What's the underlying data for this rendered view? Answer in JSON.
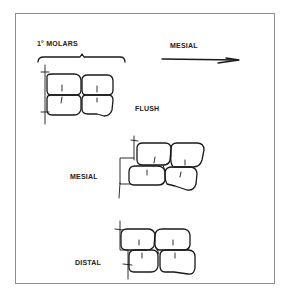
{
  "figure": {
    "header_label": "1° MOLARS",
    "direction_label": "MESIAL",
    "direction_arrow": "arrow-right",
    "panels": [
      {
        "id": "flush",
        "label": "FLUSH"
      },
      {
        "id": "mesial",
        "label": "MESIAL"
      },
      {
        "id": "distal",
        "label": "DISTAL"
      }
    ]
  },
  "colors": {
    "ink": "#1a1a1a",
    "frame": "#8c8c8c",
    "background": "#ffffff"
  }
}
